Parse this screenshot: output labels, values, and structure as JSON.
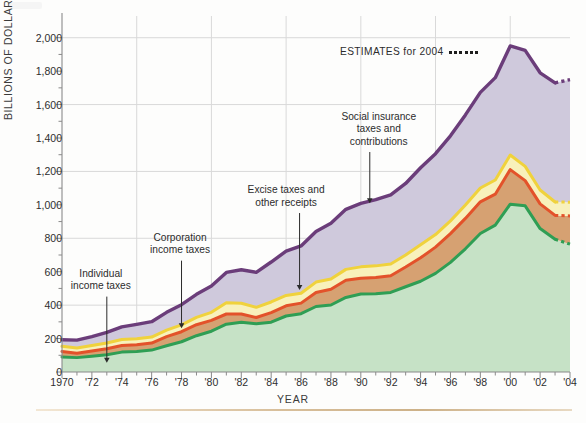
{
  "chart_data": {
    "type": "area",
    "stacked": true,
    "title": "",
    "xlabel": "YEAR",
    "ylabel": "BILLIONS OF DOLLARS",
    "xlim": [
      1970,
      2004
    ],
    "ylim": [
      0,
      2100
    ],
    "yticks": [
      0,
      200,
      400,
      600,
      800,
      1000,
      1200,
      1400,
      1600,
      1800,
      2000
    ],
    "ytick_labels": [
      "0",
      "200",
      "400",
      "600",
      "800",
      "1,000",
      "1,200",
      "1,400",
      "1,600",
      "1,800",
      "2,000"
    ],
    "gridlines_y": [
      400,
      800,
      1200,
      1600,
      2000
    ],
    "gridlines_x": [
      1975,
      1980,
      1985,
      1990,
      1995,
      2000
    ],
    "xticks": [
      1970,
      1971,
      1972,
      1973,
      1974,
      1975,
      1976,
      1977,
      1978,
      1979,
      1980,
      1981,
      1982,
      1983,
      1984,
      1985,
      1986,
      1987,
      1988,
      1989,
      1990,
      1991,
      1992,
      1993,
      1994,
      1995,
      1996,
      1997,
      1998,
      1999,
      2000,
      2001,
      2002,
      2003,
      2004
    ],
    "xtick_labels_major": [
      {
        "x": 1970,
        "label": "1970"
      },
      {
        "x": 1972,
        "label": "'72"
      },
      {
        "x": 1974,
        "label": "'74"
      },
      {
        "x": 1976,
        "label": "'76"
      },
      {
        "x": 1978,
        "label": "'78"
      },
      {
        "x": 1980,
        "label": "'80"
      },
      {
        "x": 1982,
        "label": "'82"
      },
      {
        "x": 1984,
        "label": "'84"
      },
      {
        "x": 1986,
        "label": "'86"
      },
      {
        "x": 1988,
        "label": "'88"
      },
      {
        "x": 1990,
        "label": "'90"
      },
      {
        "x": 1992,
        "label": "'92"
      },
      {
        "x": 1994,
        "label": "'94"
      },
      {
        "x": 1996,
        "label": "'96"
      },
      {
        "x": 1998,
        "label": "'98"
      },
      {
        "x": 2000,
        "label": "'00"
      },
      {
        "x": 2002,
        "label": "'02"
      },
      {
        "x": 2004,
        "label": "'04"
      }
    ],
    "x": [
      1970,
      1971,
      1972,
      1973,
      1974,
      1975,
      1976,
      1977,
      1978,
      1979,
      1980,
      1981,
      1982,
      1983,
      1984,
      1985,
      1986,
      1987,
      1988,
      1989,
      1990,
      1991,
      1992,
      1993,
      1994,
      1995,
      1996,
      1997,
      1998,
      1999,
      2000,
      2001,
      2002,
      2003,
      2004
    ],
    "series": [
      {
        "name": "Individual income taxes",
        "color": "#2f9e54",
        "fill": "#c6e2c6",
        "values": [
          90,
          86,
          94,
          103,
          119,
          122,
          131,
          157,
          181,
          217,
          244,
          286,
          298,
          289,
          298,
          335,
          349,
          392,
          401,
          446,
          467,
          468,
          476,
          510,
          543,
          590,
          656,
          737,
          829,
          879,
          1004,
          994,
          858,
          794,
          765
        ]
      },
      {
        "name": "Corporation income taxes",
        "color": "#e3522a",
        "fill": "#d6a172",
        "values": [
          33,
          26,
          32,
          36,
          39,
          41,
          42,
          55,
          60,
          66,
          65,
          61,
          49,
          37,
          57,
          61,
          63,
          84,
          94,
          103,
          94,
          98,
          100,
          118,
          140,
          157,
          172,
          182,
          189,
          185,
          207,
          151,
          148,
          143,
          169
        ]
      },
      {
        "name": "Excise taxes and other receipts",
        "color": "#f0d23c",
        "fill": "#f8f1bb",
        "values": [
          31,
          31,
          33,
          34,
          36,
          36,
          36,
          39,
          41,
          44,
          48,
          67,
          64,
          61,
          64,
          62,
          59,
          62,
          61,
          65,
          68,
          69,
          70,
          72,
          78,
          75,
          76,
          80,
          83,
          85,
          87,
          85,
          83,
          80,
          82
        ]
      },
      {
        "name": "Social insurance taxes and contributions",
        "color": "#6b3d7a",
        "fill": "#cfc9dc",
        "values": [
          39,
          48,
          53,
          64,
          76,
          86,
          92,
          106,
          121,
          138,
          157,
          182,
          201,
          209,
          239,
          265,
          283,
          303,
          334,
          359,
          380,
          396,
          414,
          428,
          461,
          484,
          509,
          539,
          572,
          612,
          653,
          694,
          701,
          713,
          733
        ]
      }
    ],
    "estimate_note": "ESTIMATES for 2004",
    "estimate_marker_dots": 6,
    "estimate_from_year": 2003,
    "annotations": [
      {
        "label": "Individual\nincome taxes",
        "text_x": 1972.6,
        "text_y": 475,
        "arrow_to_x": 1973.0,
        "arrow_to_y": 55
      },
      {
        "label": "Corporation\nincome taxes",
        "text_x": 1977.9,
        "text_y": 690,
        "arrow_to_x": 1978.0,
        "arrow_to_y": 262
      },
      {
        "label": "Excise taxes and\nother receipts",
        "text_x": 1985.0,
        "text_y": 975,
        "arrow_to_x": 1985.9,
        "arrow_to_y": 490
      },
      {
        "label": "Social insurance\ntaxes and\ncontributions",
        "text_x": 1991.2,
        "text_y": 1340,
        "arrow_to_x": 1990.6,
        "arrow_to_y": 1010
      }
    ],
    "colors": {
      "individual": "#2f9e54",
      "corporation": "#e3522a",
      "excise": "#f0d23c",
      "social_insurance": "#6b3d7a",
      "grid": "#d9d9d9",
      "axis": "#8a8a8a",
      "rule": "#d8bf9b"
    }
  }
}
